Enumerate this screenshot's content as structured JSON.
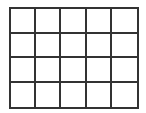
{
  "grid": {
    "columns": 5,
    "rows": 4,
    "line_color": "#333333",
    "background": "#ffffff",
    "cells": [
      [
        "",
        "",
        "",
        "",
        ""
      ],
      [
        "",
        "",
        "",
        "",
        ""
      ],
      [
        "",
        "",
        "",
        "",
        ""
      ],
      [
        "",
        "",
        "",
        "",
        ""
      ]
    ]
  }
}
